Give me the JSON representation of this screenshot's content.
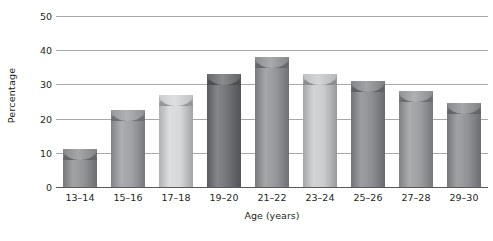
{
  "chart_data": {
    "type": "bar",
    "title": "",
    "subtitle": "",
    "xlabel": "Age (years)",
    "ylabel": "Percentage",
    "categories": [
      "13–14",
      "15–16",
      "17–18",
      "19–20",
      "21–22",
      "23–24",
      "25–26",
      "27–28",
      "29–30"
    ],
    "values": [
      11,
      22.5,
      27,
      33,
      38,
      33,
      31,
      28,
      24.5
    ],
    "ylim": [
      0,
      50
    ],
    "yticks": [
      0,
      10,
      20,
      30,
      40,
      50
    ],
    "ytick_labels": [
      "0",
      "10",
      "20",
      "30",
      "40",
      "50"
    ],
    "grid": true,
    "legend": "none",
    "series": [
      {
        "name": "Percentage",
        "values": [
          11,
          22.5,
          27,
          33,
          38,
          33,
          31,
          28,
          24.5
        ]
      }
    ],
    "bar_style": "3d-cylinder",
    "bar_colors": [
      "#8f9194",
      "#9d9fa2",
      "#d5d7d9",
      "#6d6f72",
      "#939598",
      "#c9cbcd",
      "#8a8c8f",
      "#9a9c9f",
      "#8e9093"
    ]
  },
  "axes": {
    "y_title": "Percentage",
    "x_title": "Age (years)"
  },
  "colors": {
    "gridline": "#a7a9ac",
    "baseline": "#58595b",
    "text": "#231f20",
    "background": "#ffffff"
  }
}
